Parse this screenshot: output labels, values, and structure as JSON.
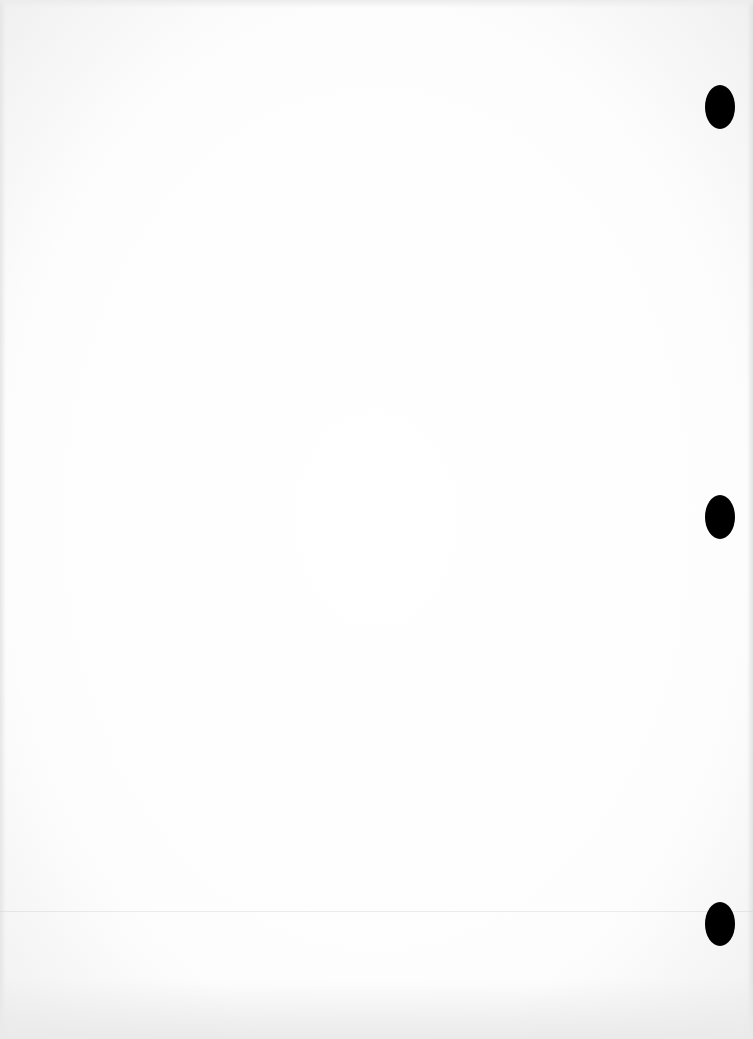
{
  "document": {
    "type": "blank scanned page",
    "background_color": "#ffffff",
    "punch_holes": [
      {
        "name": "punch-hole-top",
        "x": 720,
        "y": 107
      },
      {
        "name": "punch-hole-middle",
        "x": 720,
        "y": 517
      },
      {
        "name": "punch-hole-bottom",
        "x": 720,
        "y": 924
      }
    ],
    "hole_color": "#000000"
  }
}
